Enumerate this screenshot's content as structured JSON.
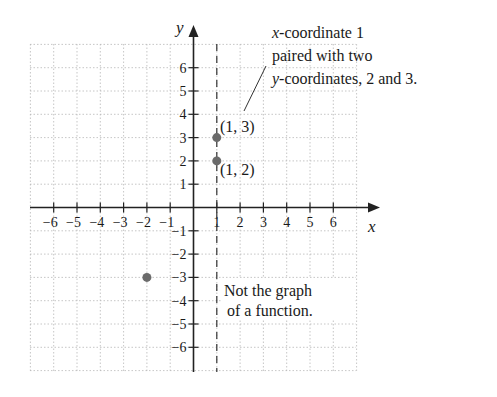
{
  "chart_data": {
    "type": "scatter",
    "title": "",
    "xlabel": "x",
    "ylabel": "y",
    "xlim": [
      -6.9,
      7.0
    ],
    "ylim": [
      -7.0,
      7.0
    ],
    "grid": true,
    "x_ticks": [
      -6,
      -5,
      -4,
      -3,
      -2,
      -1,
      1,
      2,
      3,
      4,
      5,
      6
    ],
    "y_ticks": [
      6,
      5,
      4,
      3,
      2,
      1,
      -1,
      -2,
      -3,
      -4,
      -5,
      -6
    ],
    "x_tick_labels": [
      "−6",
      "−5",
      "−4",
      "−3",
      "−2",
      "−1",
      "1",
      "2",
      "3",
      "4",
      "5",
      "6"
    ],
    "y_tick_labels": [
      "6",
      "5",
      "4",
      "3",
      "2",
      "1",
      "−1",
      "−2",
      "−3",
      "−4",
      "−5",
      "−6"
    ],
    "series": [
      {
        "name": "points",
        "points": [
          {
            "x": 1,
            "y": 3,
            "label": "(1, 3)"
          },
          {
            "x": 1,
            "y": 2,
            "label": "(1, 2)"
          },
          {
            "x": -2,
            "y": -3,
            "label": ""
          }
        ],
        "color": "#6b6b6b"
      }
    ],
    "vertical_line": {
      "x": 1,
      "style": "dashed"
    },
    "annotations": [
      {
        "id": "callout",
        "lines": [
          "x-coordinate 1",
          "paired with two",
          "y-coordinates, 2 and 3."
        ]
      },
      {
        "id": "note",
        "lines": [
          "Not the graph",
          "of a function."
        ]
      }
    ]
  },
  "labels": {
    "x_axis": "x",
    "y_axis": "y",
    "p13": "(1, 3)",
    "p12": "(1, 2)",
    "callout_1_italic": "x",
    "callout_1_rest": "-coordinate 1",
    "callout_2": "paired with two",
    "callout_3_italic": "y",
    "callout_3_rest": "-coordinates, 2 and 3.",
    "note_1": "Not the graph",
    "note_2": "of a function."
  }
}
